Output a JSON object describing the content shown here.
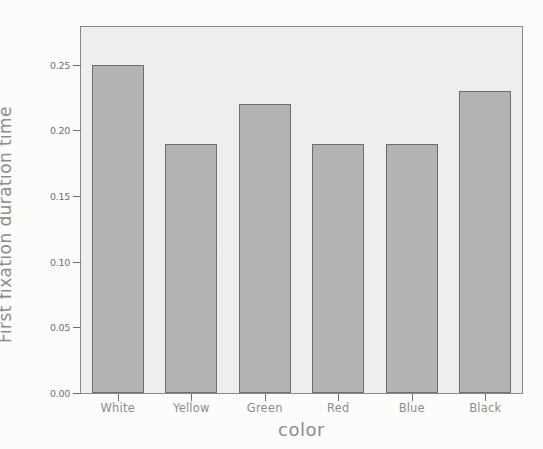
{
  "chart_data": {
    "type": "bar",
    "title": "",
    "categories": [
      "White",
      "Yellow",
      "Green",
      "Red",
      "Blue",
      "Black"
    ],
    "values": [
      0.25,
      0.19,
      0.22,
      0.19,
      0.19,
      0.23
    ],
    "xlabel": "color",
    "ylabel": "First fixation duration time",
    "ytick_labels": [
      "0.00",
      "0.05",
      "0.10",
      "0.15",
      "0.20",
      "0.25"
    ],
    "ytick_values": [
      0.0,
      0.05,
      0.1,
      0.15,
      0.2,
      0.25
    ],
    "ylim": [
      0.0,
      0.2788
    ],
    "grid": false,
    "legend": false,
    "bar_fill_color": "#b4b4b4",
    "bar_edge_color": "#6f6f6f",
    "plot_background_color": "#efefee",
    "axis_color": "#6f6f6f",
    "text_color": "#8d8d8d"
  }
}
